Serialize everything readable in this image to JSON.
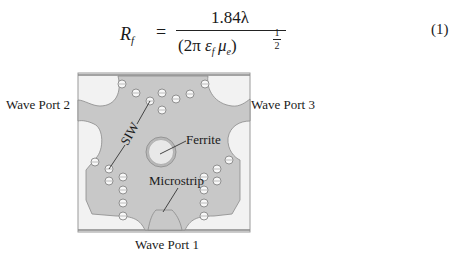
{
  "equation": {
    "lhs_symbol": "R",
    "lhs_subscript": "f",
    "equals": "=",
    "numerator": "1.84λ",
    "denominator_open": "(2π ",
    "denominator_eps": "ε",
    "denominator_eps_sub": "f",
    "denominator_mu": "μ",
    "denominator_mu_sub": "e",
    "denominator_close": ")",
    "exponent_num": "1",
    "exponent_den": "2",
    "number": "(1)"
  },
  "figure": {
    "labels": {
      "port1": "Wave Port 1",
      "port2": "Wave Port 2",
      "port3": "Wave Port 3",
      "siw": "SIW",
      "ferrite": "Ferrite",
      "microstrip": "Microstrip"
    },
    "colors": {
      "substrate": "#f2f2f2",
      "metal": "#c8c8c8",
      "outline": "#8a8a8a",
      "ferrite_fill": "#e6e6e6",
      "via_fill": "#f7f7f7"
    }
  }
}
